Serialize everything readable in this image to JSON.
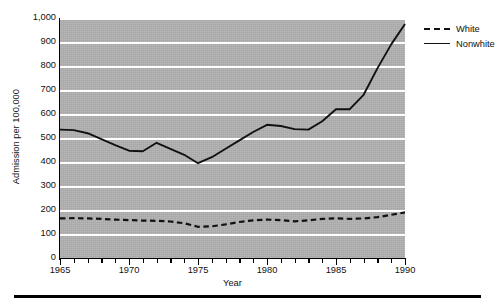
{
  "chart_data": {
    "type": "line",
    "title": "",
    "xlabel": "Year",
    "ylabel": "Admission per 100,000",
    "xlim": [
      1965,
      1990
    ],
    "ylim": [
      0,
      1000
    ],
    "ytick_step": 100,
    "xtick_step": 1,
    "xtick_label_step": 5,
    "grid": true,
    "legend_position": "top-right-outside",
    "plot_background": "#b2b2b2",
    "gridline_color": "#ffffff",
    "line_color": "#111111",
    "x": [
      1965,
      1966,
      1967,
      1968,
      1969,
      1970,
      1971,
      1972,
      1973,
      1974,
      1975,
      1976,
      1977,
      1978,
      1979,
      1980,
      1981,
      1982,
      1983,
      1984,
      1985,
      1986,
      1987,
      1988,
      1989,
      1990
    ],
    "series": [
      {
        "name": "White",
        "style": "dashed",
        "values": [
          165,
          166,
          165,
          163,
          160,
          158,
          156,
          155,
          152,
          145,
          130,
          132,
          140,
          150,
          157,
          160,
          158,
          153,
          157,
          163,
          165,
          163,
          165,
          170,
          180,
          190
        ]
      },
      {
        "name": "Nonwhite",
        "style": "solid",
        "values": [
          535,
          533,
          520,
          495,
          470,
          447,
          445,
          480,
          455,
          430,
          395,
          420,
          455,
          490,
          525,
          555,
          550,
          537,
          535,
          570,
          620,
          620,
          680,
          790,
          890,
          975
        ]
      }
    ],
    "ytick_labels": [
      "0",
      "100",
      "200",
      "300",
      "400",
      "500",
      "600",
      "700",
      "800",
      "900",
      "1,000"
    ],
    "xtick_labels": [
      "1965",
      "1970",
      "1975",
      "1980",
      "1985",
      "1990"
    ]
  },
  "legend": {
    "entries": [
      {
        "label": "White"
      },
      {
        "label": "Nonwhite"
      }
    ]
  }
}
